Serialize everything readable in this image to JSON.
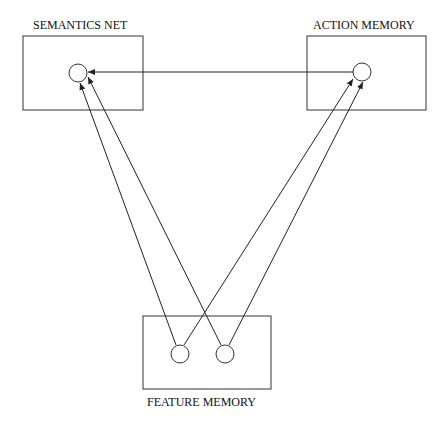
{
  "diagram": {
    "nodes": [
      {
        "id": "semantics",
        "label": "SEMANTICS NET"
      },
      {
        "id": "action",
        "label": "ACTION MEMORY"
      },
      {
        "id": "feature",
        "label": "FEATURE MEMORY"
      }
    ],
    "edges": [
      {
        "from": "action",
        "to": "semantics"
      },
      {
        "from": "feature-unit-1",
        "to": "semantics"
      },
      {
        "from": "feature-unit-2",
        "to": "semantics"
      },
      {
        "from": "feature-unit-1",
        "to": "action"
      },
      {
        "from": "feature-unit-2",
        "to": "action"
      }
    ],
    "line_color": "#222222"
  }
}
